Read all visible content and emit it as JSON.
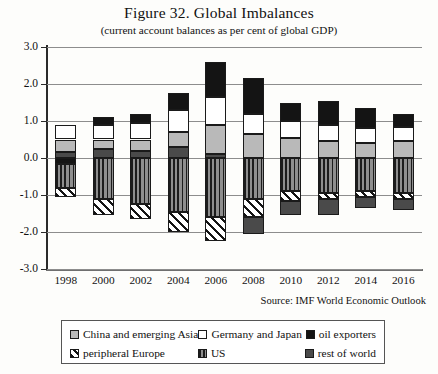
{
  "chart_data": {
    "type": "bar",
    "title": "Figure 32. Global Imbalances",
    "subtitle": "(current account balances as per cent of global GDP)",
    "source": "Source: IMF World Economic Outlook",
    "xlabel": "",
    "ylabel": "",
    "stacked": true,
    "grid": true,
    "legend_position": "bottom",
    "ylim": [
      -3.0,
      3.0
    ],
    "yticks": [
      "3.0",
      "2.0",
      "1.0",
      "0.0",
      "-1.0",
      "-2.0",
      "-3.0"
    ],
    "ytick_values": [
      3.0,
      2.0,
      1.0,
      0.0,
      -1.0,
      -2.0,
      -3.0
    ],
    "categories": [
      "1998",
      "2000",
      "2002",
      "2004",
      "2006",
      "2008",
      "2010",
      "2012",
      "2014",
      "2016"
    ],
    "series": [
      {
        "name": "China and emerging Asia",
        "key": "china",
        "color": "#b9b9b9",
        "pattern": "solid-light-gray",
        "values": [
          0.35,
          0.25,
          0.3,
          0.4,
          0.8,
          0.65,
          0.55,
          0.45,
          0.4,
          0.45
        ]
      },
      {
        "name": "Germany and Japan",
        "key": "germany",
        "color": "#ffffff",
        "pattern": "solid-white",
        "values": [
          0.4,
          0.4,
          0.45,
          0.6,
          0.75,
          0.55,
          0.45,
          0.45,
          0.4,
          0.4
        ]
      },
      {
        "name": "oil exporters",
        "key": "oil",
        "color": "#141414",
        "pattern": "solid-black",
        "values": [
          -0.15,
          0.2,
          0.25,
          0.45,
          0.95,
          0.95,
          0.5,
          0.65,
          0.55,
          0.35
        ]
      },
      {
        "name": "peripheral Europe",
        "key": "europe",
        "color": "#141414",
        "pattern": "diagonal-hatch",
        "values": [
          -0.25,
          -0.45,
          -0.4,
          -0.55,
          -0.65,
          -0.5,
          -0.25,
          -0.15,
          -0.15,
          -0.15
        ]
      },
      {
        "name": "US",
        "key": "us",
        "color": "#1c1c1c",
        "pattern": "vertical-stripes",
        "values": [
          -0.65,
          -1.1,
          -1.25,
          -1.45,
          -1.6,
          -1.1,
          -0.9,
          -0.95,
          -0.9,
          -0.95
        ]
      },
      {
        "name": "rest of world",
        "key": "row",
        "color": "#4a4a4a",
        "pattern": "solid-dark-gray",
        "values": [
          0.15,
          0.25,
          0.2,
          0.3,
          0.1,
          -0.45,
          -0.4,
          -0.45,
          -0.3,
          -0.3
        ]
      }
    ],
    "positive_totals": [
      0.75,
      1.1,
      1.2,
      1.75,
      2.6,
      2.15,
      1.8,
      1.75,
      1.5,
      1.35
    ],
    "negative_totals": [
      -0.9,
      -1.55,
      -1.65,
      -2.0,
      -2.25,
      -2.05,
      -1.55,
      -1.55,
      -1.35,
      -1.4
    ]
  },
  "legend": {
    "items": [
      {
        "label": "China and emerging Asia",
        "swatch": "china"
      },
      {
        "label": "Germany and Japan",
        "swatch": "germany"
      },
      {
        "label": "oil exporters",
        "swatch": "oil"
      },
      {
        "label": "peripheral Europe",
        "swatch": "europe"
      },
      {
        "label": "US",
        "swatch": "us"
      },
      {
        "label": "rest of world",
        "swatch": "row"
      }
    ]
  }
}
